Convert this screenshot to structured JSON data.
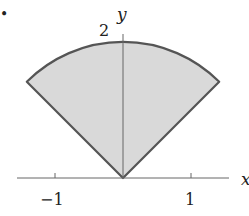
{
  "figure": {
    "type": "circular-sector-region",
    "marker_dot": "•",
    "axes": {
      "x_label": "x",
      "y_label": "y",
      "x_ticks": [
        {
          "value": -1,
          "label": "−1"
        },
        {
          "value": 1,
          "label": "1"
        }
      ],
      "y_ticks": [
        {
          "value": 2,
          "label": "2"
        }
      ]
    },
    "region": {
      "radius": 2,
      "theta_start_deg": 45,
      "theta_end_deg": 135,
      "fill_color": "#d9d9d9",
      "stroke_color": "#555555"
    }
  }
}
